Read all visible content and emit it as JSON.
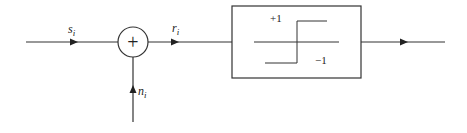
{
  "diagram": {
    "type": "block-diagram",
    "input_label": {
      "base": "s",
      "sub": "i"
    },
    "noise_label": {
      "base": "n",
      "sub": "i"
    },
    "sum_output_label": {
      "base": "r",
      "sub": "i"
    },
    "summer_symbol": "+",
    "limiter": {
      "upper_level": "+1",
      "lower_level": "−1"
    },
    "colors": {
      "stroke": "#333333",
      "text": "#222222",
      "background": "#ffffff"
    }
  }
}
